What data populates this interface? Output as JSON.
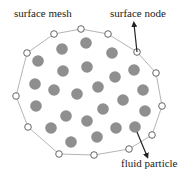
{
  "labels": {
    "surface_mesh": "surface mesh",
    "surface_node": "surface node",
    "fluid_particle": "fluid particle"
  },
  "colors": {
    "particle": "#8f8f8f",
    "mesh_line": "#b5b5b5",
    "node_stroke": "#555555",
    "node_fill": "#ffffff",
    "arrow": "#222222"
  },
  "surface_nodes": [
    [
      54,
      34
    ],
    [
      81,
      29
    ],
    [
      108,
      34
    ],
    [
      137,
      52
    ],
    [
      156,
      73
    ],
    [
      162,
      106
    ],
    [
      152,
      135
    ],
    [
      129,
      149
    ],
    [
      94,
      155
    ],
    [
      59,
      154
    ],
    [
      28,
      127
    ],
    [
      16,
      96
    ],
    [
      27,
      53
    ]
  ],
  "fluid_particles": [
    [
      62,
      49
    ],
    [
      86,
      43
    ],
    [
      112,
      53
    ],
    [
      38,
      61
    ],
    [
      63,
      71
    ],
    [
      87,
      67
    ],
    [
      134,
      70
    ],
    [
      115,
      77
    ],
    [
      35,
      84
    ],
    [
      54,
      90
    ],
    [
      77,
      94
    ],
    [
      98,
      87
    ],
    [
      143,
      90
    ],
    [
      123,
      100
    ],
    [
      36,
      106
    ],
    [
      66,
      116
    ],
    [
      87,
      121
    ],
    [
      103,
      109
    ],
    [
      145,
      111
    ],
    [
      51,
      128
    ],
    [
      71,
      142
    ],
    [
      97,
      137
    ],
    [
      116,
      128
    ],
    [
      135,
      127
    ]
  ],
  "arrows": {
    "surface_node": {
      "from": [
        137,
        52
      ],
      "to": [
        134,
        24
      ]
    },
    "fluid_particle": {
      "from": [
        137,
        132
      ],
      "to": [
        147,
        156
      ]
    }
  }
}
